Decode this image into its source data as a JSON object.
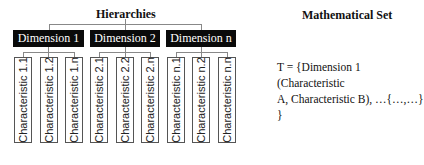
{
  "hierarchies": {
    "title": "Hierarchies",
    "dimensions": [
      {
        "label": "Dimension 1",
        "characteristics": [
          "Characteristic 1.1",
          "Characteristic 1.2",
          "Characteristic 1.n"
        ]
      },
      {
        "label": "Dimension 2",
        "characteristics": [
          "Characteristic 2.1",
          "Characteristic 2.2",
          "Characteristic 2.n"
        ]
      },
      {
        "label": "Dimension n",
        "characteristics": [
          "Characteristic n.1",
          "Characteristic n.2",
          "Characteristic n.n"
        ]
      }
    ]
  },
  "set": {
    "title": "Mathematical Set",
    "line1": "T = {Dimension 1 (Characteristic",
    "line2": "A, Characteristic B), …{…,…}",
    "line3": "}"
  },
  "colors": {
    "dimension_bg": "#0a0a0a",
    "dimension_text": "#ffffff",
    "connector": "#888888"
  }
}
